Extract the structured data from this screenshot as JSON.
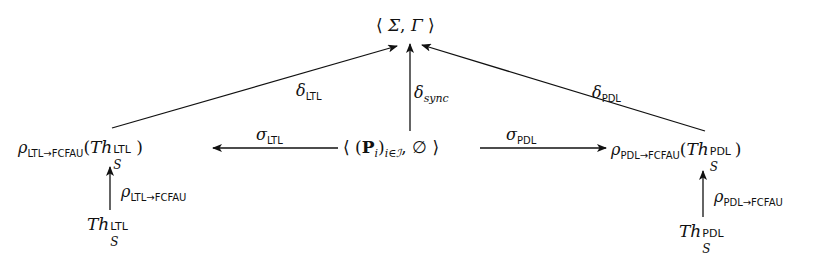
{
  "diagram": {
    "type": "commutative-diagram",
    "nodes": {
      "top": {
        "id": "sigma-gamma",
        "open": "⟨",
        "sigma": "Σ",
        "comma": ",",
        "gamma": "Γ",
        "close": "⟩"
      },
      "center": {
        "id": "products-empty",
        "open": "⟨",
        "lparen": "(",
        "P": "P",
        "i": "i",
        "rparen": ")",
        "index": "i∈ℐ",
        "comma": ",",
        "empty": "∅",
        "close": "⟩"
      },
      "left": {
        "id": "rho-ltl-theory",
        "rho": "ρ",
        "sub": "LTL→FCFAU",
        "paren_open": "(",
        "Th": "Th",
        "S": "S",
        "sup": "LTL",
        "paren_close": ")"
      },
      "right": {
        "id": "rho-pdl-theory",
        "rho": "ρ",
        "sub": "PDL→FCFAU",
        "paren_open": "(",
        "Th": "Th",
        "S": "S",
        "sup": "PDL",
        "paren_close": ")"
      },
      "bottom_left": {
        "id": "th-ltl",
        "Th": "Th",
        "S": "S",
        "sup": "LTL"
      },
      "bottom_right": {
        "id": "th-pdl",
        "Th": "Th",
        "S": "S",
        "sup": "PDL"
      }
    },
    "edges": [
      {
        "id": "delta-ltl",
        "from": "left",
        "to": "top",
        "symbol": "δ",
        "sub": "LTL"
      },
      {
        "id": "delta-sync",
        "from": "center",
        "to": "top",
        "symbol": "δ",
        "sub": "sync"
      },
      {
        "id": "delta-pdl",
        "from": "right",
        "to": "top",
        "symbol": "δ",
        "sub": "PDL"
      },
      {
        "id": "sigma-ltl",
        "from": "center",
        "to": "left",
        "symbol": "σ",
        "sub": "LTL"
      },
      {
        "id": "sigma-pdl",
        "from": "center",
        "to": "right",
        "symbol": "σ",
        "sub": "PDL"
      },
      {
        "id": "rho-ltl",
        "from": "bottom_left",
        "to": "left",
        "symbol": "ρ",
        "sub": "LTL→FCFAU"
      },
      {
        "id": "rho-pdl",
        "from": "bottom_right",
        "to": "right",
        "symbol": "ρ",
        "sub": "PDL→FCFAU"
      }
    ],
    "colors": {
      "ink": "#111111",
      "background": "#ffffff"
    }
  }
}
